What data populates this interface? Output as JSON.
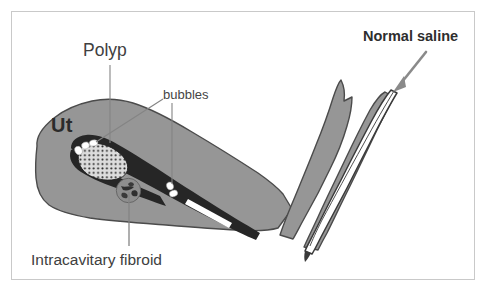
{
  "figure": {
    "domain": "medical-illustration",
    "border_color": "#c9c9c9",
    "background_color": "#ffffff"
  },
  "labels": {
    "polyp": "Polyp",
    "bubbles": "bubbles",
    "uterus_abbrev": "Ut",
    "fibroid": "Intracavitary fibroid",
    "saline": "Normal saline"
  },
  "colors": {
    "uterus_body": "#969696",
    "uterus_outline": "#4a4a4a",
    "cavity": "#262626",
    "polyp_fill": "#d8d8d8",
    "polyp_stipple": "#2b2b2b",
    "bubble_fill": "#ffffff",
    "fibroid_fill": "#8e8e8e",
    "fibroid_outline": "#3d3d3d",
    "catheter_fill": "#ffffff",
    "catheter_outline": "#3a3a3a",
    "leader_line": "#777777",
    "arrow": "#8a8a8a",
    "text": "#3b3b3b"
  },
  "structures": [
    {
      "name": "uterine-body",
      "label": "Ut",
      "fill": "#969696"
    },
    {
      "name": "endometrial-cavity",
      "label": "",
      "fill": "#262626"
    },
    {
      "name": "endometrial-polyp",
      "label": "Polyp",
      "fill": "#d8d8d8"
    },
    {
      "name": "intracavitary-fibroid",
      "label": "Intracavitary fibroid",
      "fill": "#8e8e8e"
    },
    {
      "name": "air-bubbles",
      "label": "bubbles",
      "fill": "#ffffff",
      "count": 6
    },
    {
      "name": "cervix-vagina",
      "label": "",
      "fill": "#969696"
    },
    {
      "name": "saline-catheter",
      "label": "Normal saline",
      "fill": "#ffffff"
    }
  ],
  "annotations": [
    {
      "name": "polyp-leader",
      "from": "Polyp",
      "to": "endometrial-polyp",
      "style": "vertical-line"
    },
    {
      "name": "bubbles-leader-left",
      "from": "bubbles",
      "to": "left-bubble-cluster",
      "style": "diagonal-line"
    },
    {
      "name": "bubbles-leader-right",
      "from": "bubbles",
      "to": "right-bubble-cluster",
      "style": "vertical-line"
    },
    {
      "name": "fibroid-leader",
      "from": "Intracavitary fibroid",
      "to": "intracavitary-fibroid",
      "style": "vertical-line"
    },
    {
      "name": "saline-arrow",
      "from": "Normal saline",
      "to": "saline-catheter",
      "style": "arrow"
    }
  ]
}
